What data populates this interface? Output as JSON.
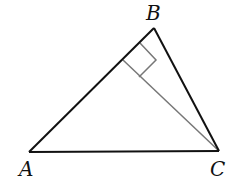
{
  "diagram": {
    "type": "triangle-with-altitude",
    "colors": {
      "triangle_stroke": "#111111",
      "altitude_stroke": "#777777",
      "background": "#ffffff"
    },
    "vertices": {
      "A": {
        "label": "A",
        "x": 29,
        "y": 152
      },
      "B": {
        "label": "B",
        "x": 154,
        "y": 28
      },
      "C": {
        "label": "C",
        "x": 219,
        "y": 151
      }
    },
    "altitude": {
      "from": "C",
      "to_side": "AB",
      "foot": {
        "x": 123,
        "y": 60
      }
    },
    "right_angle_marker": {
      "at": "foot",
      "points": [
        [
          123,
          60
        ],
        [
          140,
          43
        ],
        [
          156,
          60
        ],
        [
          139,
          77
        ]
      ]
    }
  }
}
